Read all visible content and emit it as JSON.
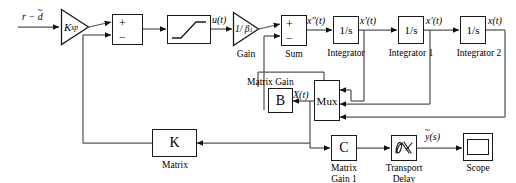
{
  "diagram": {
    "type": "control-system-block-diagram",
    "canvas": {
      "width": 516,
      "height": 183
    },
    "colors": {
      "stroke": "#1a1a1a",
      "background": "#ffffff",
      "text": "#000000"
    }
  },
  "signals": {
    "input": "r − d",
    "input_base": "r − ",
    "input_tilde_letter": "d",
    "u": "u(t)",
    "x_ddot": "x″(t)",
    "x_dot_1": "x′(t)",
    "x_dot_2": "x′(t)",
    "x": "x(t)",
    "X_state": "X(t)",
    "y_out_base": "y",
    "y_out_suffix": "(s)"
  },
  "blocks": {
    "ksp_gain": {
      "name": "K_sp gain",
      "text": "K",
      "subscript": "sp",
      "shape": "triangle"
    },
    "sum1": {
      "name": "Summing junction 1",
      "plus": "+",
      "minus": "−",
      "shape": "rect"
    },
    "saturation": {
      "name": "Saturation",
      "shape": "rect",
      "icon": "saturation-curve"
    },
    "beta_gain": {
      "name": "Gain",
      "text": "1/ β",
      "subscript": "1",
      "label": "Gain",
      "shape": "triangle"
    },
    "sum2": {
      "name": "Sum",
      "plus": "+",
      "minus": "−",
      "label": "Sum",
      "shape": "rect"
    },
    "integrator0": {
      "name": "Integrator",
      "text": "1/s",
      "label": "Integrator"
    },
    "integrator1": {
      "name": "Integrator 1",
      "text": "1/s",
      "label": "Integrator 1"
    },
    "integrator2": {
      "name": "Integrator 2",
      "text": "1/s",
      "label": "Integrator 2"
    },
    "matrix_gain_b": {
      "name": "Matrix Gain B",
      "text": "B",
      "label": "Matrix Gain"
    },
    "mux": {
      "name": "Mux",
      "text": "Mux",
      "inputs": 3
    },
    "matrix_k": {
      "name": "K Matrix",
      "text": "K",
      "label": "Matrix"
    },
    "matrix_gain_c": {
      "name": "Matrix Gain 1",
      "text": "C",
      "label": "Matrix\nGain 1"
    },
    "transport_delay": {
      "name": "Transport Delay",
      "label": "Transport\nDelay",
      "icon": "delay-waveform"
    },
    "scope": {
      "name": "Scope",
      "label": "Scope",
      "icon": "scope-screen"
    }
  }
}
